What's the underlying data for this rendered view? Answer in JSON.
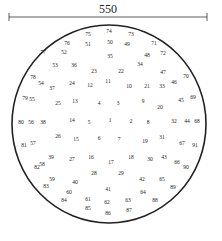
{
  "dimension": {
    "label": "550"
  },
  "points": [
    {
      "n": "75",
      "x": 88,
      "y": 35
    },
    {
      "n": "74",
      "x": 109,
      "y": 32
    },
    {
      "n": "73",
      "x": 131,
      "y": 35
    },
    {
      "n": "76",
      "x": 67,
      "y": 44
    },
    {
      "n": "51",
      "x": 88,
      "y": 45
    },
    {
      "n": "50",
      "x": 110,
      "y": 43
    },
    {
      "n": "49",
      "x": 127,
      "y": 45
    },
    {
      "n": "71",
      "x": 154,
      "y": 44
    },
    {
      "n": "77",
      "x": 43,
      "y": 53
    },
    {
      "n": "52",
      "x": 64,
      "y": 53
    },
    {
      "n": "35",
      "x": 110,
      "y": 57
    },
    {
      "n": "48",
      "x": 147,
      "y": 56
    },
    {
      "n": "72",
      "x": 163,
      "y": 54
    },
    {
      "n": "53",
      "x": 55,
      "y": 66
    },
    {
      "n": "36",
      "x": 74,
      "y": 66
    },
    {
      "n": "23",
      "x": 94,
      "y": 72
    },
    {
      "n": "22",
      "x": 121,
      "y": 72
    },
    {
      "n": "34",
      "x": 140,
      "y": 65
    },
    {
      "n": "47",
      "x": 163,
      "y": 73
    },
    {
      "n": "78",
      "x": 33,
      "y": 78
    },
    {
      "n": "54",
      "x": 41,
      "y": 84
    },
    {
      "n": "37",
      "x": 52,
      "y": 89
    },
    {
      "n": "24",
      "x": 72,
      "y": 84
    },
    {
      "n": "12",
      "x": 90,
      "y": 86
    },
    {
      "n": "11",
      "x": 108,
      "y": 82
    },
    {
      "n": "10",
      "x": 129,
      "y": 87
    },
    {
      "n": "21",
      "x": 147,
      "y": 87
    },
    {
      "n": "33",
      "x": 162,
      "y": 87
    },
    {
      "n": "46",
      "x": 174,
      "y": 83
    },
    {
      "n": "70",
      "x": 186,
      "y": 77
    },
    {
      "n": "79",
      "x": 25,
      "y": 99
    },
    {
      "n": "55",
      "x": 32,
      "y": 100
    },
    {
      "n": "25",
      "x": 58,
      "y": 104
    },
    {
      "n": "13",
      "x": 75,
      "y": 102
    },
    {
      "n": "4",
      "x": 99,
      "y": 104
    },
    {
      "n": "3",
      "x": 118,
      "y": 104
    },
    {
      "n": "9",
      "x": 143,
      "y": 102
    },
    {
      "n": "20",
      "x": 160,
      "y": 108
    },
    {
      "n": "45",
      "x": 181,
      "y": 101
    },
    {
      "n": "69",
      "x": 193,
      "y": 98
    },
    {
      "n": "80",
      "x": 21,
      "y": 123
    },
    {
      "n": "56",
      "x": 31,
      "y": 123
    },
    {
      "n": "38",
      "x": 43,
      "y": 123
    },
    {
      "n": "14",
      "x": 72,
      "y": 121
    },
    {
      "n": "5",
      "x": 89,
      "y": 123
    },
    {
      "n": "1",
      "x": 110,
      "y": 121
    },
    {
      "n": "2",
      "x": 131,
      "y": 122
    },
    {
      "n": "8",
      "x": 148,
      "y": 123
    },
    {
      "n": "32",
      "x": 174,
      "y": 122
    },
    {
      "n": "44",
      "x": 187,
      "y": 122
    },
    {
      "n": "68",
      "x": 197,
      "y": 122
    },
    {
      "n": "26",
      "x": 58,
      "y": 137
    },
    {
      "n": "15",
      "x": 76,
      "y": 140
    },
    {
      "n": "6",
      "x": 99,
      "y": 139
    },
    {
      "n": "7",
      "x": 119,
      "y": 140
    },
    {
      "n": "19",
      "x": 145,
      "y": 142
    },
    {
      "n": "31",
      "x": 162,
      "y": 138
    },
    {
      "n": "67",
      "x": 182,
      "y": 144
    },
    {
      "n": "91",
      "x": 195,
      "y": 146
    },
    {
      "n": "81",
      "x": 24,
      "y": 146
    },
    {
      "n": "57",
      "x": 33,
      "y": 144
    },
    {
      "n": "39",
      "x": 51,
      "y": 158
    },
    {
      "n": "27",
      "x": 72,
      "y": 160
    },
    {
      "n": "16",
      "x": 91,
      "y": 158
    },
    {
      "n": "17",
      "x": 111,
      "y": 163
    },
    {
      "n": "18",
      "x": 131,
      "y": 158
    },
    {
      "n": "30",
      "x": 150,
      "y": 160
    },
    {
      "n": "43",
      "x": 164,
      "y": 158
    },
    {
      "n": "66",
      "x": 177,
      "y": 163
    },
    {
      "n": "90",
      "x": 186,
      "y": 168
    },
    {
      "n": "82",
      "x": 37,
      "y": 168
    },
    {
      "n": "58",
      "x": 42,
      "y": 165
    },
    {
      "n": "59",
      "x": 52,
      "y": 180
    },
    {
      "n": "40",
      "x": 75,
      "y": 183
    },
    {
      "n": "28",
      "x": 94,
      "y": 174
    },
    {
      "n": "29",
      "x": 121,
      "y": 174
    },
    {
      "n": "42",
      "x": 142,
      "y": 180
    },
    {
      "n": "65",
      "x": 162,
      "y": 180
    },
    {
      "n": "89",
      "x": 173,
      "y": 188
    },
    {
      "n": "83",
      "x": 46,
      "y": 187
    },
    {
      "n": "60",
      "x": 69,
      "y": 193
    },
    {
      "n": "41",
      "x": 108,
      "y": 190
    },
    {
      "n": "64",
      "x": 143,
      "y": 193
    },
    {
      "n": "84",
      "x": 64,
      "y": 201
    },
    {
      "n": "61",
      "x": 88,
      "y": 200
    },
    {
      "n": "62",
      "x": 107,
      "y": 203
    },
    {
      "n": "63",
      "x": 128,
      "y": 201
    },
    {
      "n": "88",
      "x": 155,
      "y": 201
    },
    {
      "n": "85",
      "x": 88,
      "y": 209
    },
    {
      "n": "86",
      "x": 108,
      "y": 214
    },
    {
      "n": "87",
      "x": 129,
      "y": 211
    }
  ]
}
